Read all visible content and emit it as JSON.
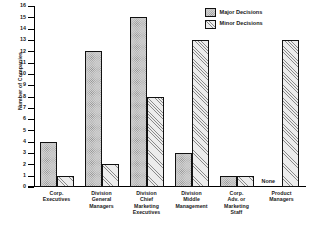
{
  "chart_data": {
    "type": "bar",
    "title": "",
    "xlabel": "",
    "ylabel": "Number of Companies",
    "ylim": [
      0,
      16
    ],
    "ytick_step": 1,
    "yticks": [
      0,
      1,
      2,
      3,
      4,
      5,
      6,
      7,
      8,
      9,
      10,
      11,
      12,
      13,
      14,
      15,
      16
    ],
    "grid": false,
    "legend_position": "top-right",
    "categories": [
      "Corp. Executives",
      "Division General Managers",
      "Division Chief Marketing Executives",
      "Division Middle Management",
      "Corp. Adv. or Marketing Staff",
      "Product Managers"
    ],
    "category_lines": [
      [
        "Corp.",
        "Executives"
      ],
      [
        "Division",
        "General",
        "Managers"
      ],
      [
        "Division",
        "Chief",
        "Marketing",
        "Executives"
      ],
      [
        "Division",
        "Middle",
        "Management"
      ],
      [
        "Corp.",
        "Adv. or",
        "Marketing",
        "Staff"
      ],
      [
        "Product",
        "Managers"
      ]
    ],
    "series": [
      {
        "name": "Major Decisions",
        "fill": "stipple",
        "values": [
          4,
          12,
          15,
          3,
          1,
          0
        ]
      },
      {
        "name": "Minor Decisions",
        "fill": "diagonal-hatch",
        "values": [
          1,
          2,
          8,
          13,
          1,
          13
        ]
      }
    ],
    "annotations": [
      {
        "text": "None",
        "category": "Product Managers",
        "series": "Major Decisions"
      }
    ]
  },
  "legend": {
    "items": [
      {
        "label": "Major Decisions"
      },
      {
        "label": "Minor Decisions"
      }
    ]
  },
  "axis": {
    "y_title": "Number of Companies"
  }
}
